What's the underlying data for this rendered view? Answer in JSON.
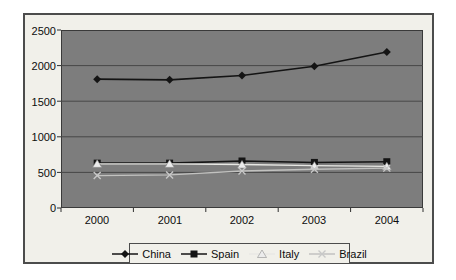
{
  "chart_data": {
    "type": "line",
    "categories": [
      "2000",
      "2001",
      "2002",
      "2003",
      "2004"
    ],
    "series": [
      {
        "name": "China",
        "marker": "diamond",
        "line_color": "#141414",
        "marker_color": "#141414",
        "values": [
          1810,
          1800,
          1860,
          1990,
          2190
        ]
      },
      {
        "name": "Spain",
        "marker": "square",
        "line_color": "#141414",
        "marker_color": "#141414",
        "values": [
          630,
          630,
          660,
          640,
          650
        ]
      },
      {
        "name": "Italy",
        "marker": "triangle",
        "line_color": "#e8e8e4",
        "marker_color": "#ececec",
        "values": [
          620,
          620,
          610,
          595,
          585
        ]
      },
      {
        "name": "Brazil",
        "marker": "x",
        "line_color": "#c2c2c0",
        "marker_color": "#c8c8c8",
        "values": [
          455,
          465,
          520,
          545,
          560
        ]
      }
    ],
    "yticks": [
      "2500",
      "2000",
      "1500",
      "1000",
      "500",
      "0"
    ],
    "ylim": [
      0,
      2500
    ],
    "ytick_step": 500,
    "xlabel": "",
    "ylabel": "",
    "title": "",
    "grid": "horizontal",
    "legend_position": "bottom",
    "plot_bg": "#7d7d7d",
    "chart_bg": "#f1f0ea",
    "gridline_color": "#474747",
    "axis_color": "#2e2e2e"
  }
}
